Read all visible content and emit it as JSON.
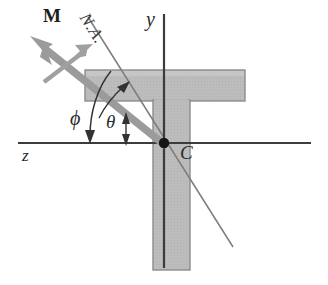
{
  "figure": {
    "background_color": "#ffffff",
    "labels": {
      "moment_vector": "M",
      "neutral_axis": "N.A.",
      "y_axis": "y",
      "z_axis": "z",
      "centroid": "C",
      "angle_phi": "ϕ",
      "angle_theta": "θ"
    },
    "colors": {
      "section_fill": "#b9b9b9",
      "section_stroke": "#8a8a8a",
      "axis_stroke": "#3c3c3c",
      "moment_vector": "#9a9a9a",
      "neutral_axis_stroke": "#777777",
      "centroid_dot": "#151515",
      "text": "#2b2b2b"
    },
    "geometry": {
      "origin": {
        "x": 164,
        "y": 143
      },
      "y_axis": {
        "x1": 164,
        "y1": 14,
        "x2": 164,
        "y2": 268
      },
      "z_axis": {
        "x1": 18,
        "y1": 143,
        "x2": 311,
        "y2": 143
      },
      "neutral_axis": {
        "x1": 88,
        "y1": 17,
        "x2": 233,
        "y2": 247
      },
      "moment_vector": {
        "tip_x": 31,
        "tip_y": 37,
        "tail_x": 166,
        "tail_y": 145
      },
      "section_flange": {
        "x": 85,
        "y": 70,
        "width": 160,
        "height": 31
      },
      "section_web": {
        "x": 153,
        "y": 101,
        "width": 37,
        "height": 169
      }
    }
  }
}
